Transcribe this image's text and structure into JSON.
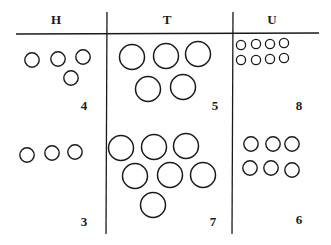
{
  "columns": [
    {
      "label": "H"
    },
    {
      "label": "T"
    },
    {
      "label": "U"
    }
  ],
  "cells": {
    "row1": [
      {
        "column": "H",
        "count": "4"
      },
      {
        "column": "T",
        "count": "5"
      },
      {
        "column": "U",
        "count": "8"
      }
    ],
    "row2": [
      {
        "column": "H",
        "count": "3"
      },
      {
        "column": "T",
        "count": "7"
      },
      {
        "column": "U",
        "count": "6"
      }
    ]
  },
  "colors": {
    "ink": "#1a1a1a",
    "background": "#ffffff"
  }
}
